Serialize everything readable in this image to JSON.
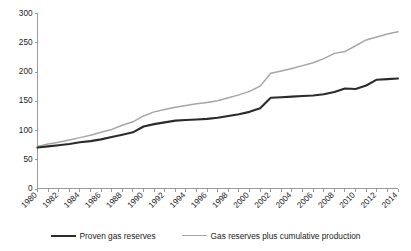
{
  "chart_data": {
    "type": "line",
    "title": "",
    "subtitle": "",
    "xlabel": "",
    "ylabel": "",
    "xlim": [
      1980,
      2014
    ],
    "ylim": [
      0,
      300
    ],
    "yticks": [
      0,
      50,
      100,
      150,
      200,
      250,
      300
    ],
    "grid": false,
    "legend_position": "bottom",
    "x": [
      1980,
      1981,
      1982,
      1983,
      1984,
      1985,
      1986,
      1987,
      1988,
      1989,
      1990,
      1991,
      1992,
      1993,
      1994,
      1995,
      1996,
      1997,
      1998,
      1999,
      2000,
      2001,
      2002,
      2003,
      2004,
      2005,
      2006,
      2007,
      2008,
      2009,
      2010,
      2011,
      2012,
      2013,
      2014
    ],
    "xtick_labels": [
      "1980",
      "1982",
      "1984",
      "1986",
      "1988",
      "1990",
      "1992",
      "1994",
      "1996",
      "1998",
      "2000",
      "2002",
      "2004",
      "2006",
      "2008",
      "2010",
      "2012",
      "2014"
    ],
    "series": [
      {
        "name": "Proven gas reserves",
        "color": "#2b2b2b",
        "values": [
          70,
          72,
          74,
          76,
          79,
          81,
          84,
          88,
          92,
          96,
          106,
          110,
          113,
          116,
          117,
          118,
          119,
          121,
          124,
          127,
          131,
          137,
          155,
          156,
          157,
          158,
          159,
          161,
          165,
          171,
          170,
          176,
          186,
          187,
          188
        ]
      },
      {
        "name": "Gas reserves plus cumulative production",
        "color": "#a6a6a6",
        "values": [
          72,
          76,
          79,
          83,
          87,
          91,
          96,
          101,
          108,
          114,
          124,
          131,
          135,
          139,
          142,
          145,
          147,
          150,
          155,
          160,
          166,
          175,
          197,
          201,
          205,
          210,
          215,
          222,
          231,
          234,
          244,
          254,
          259,
          264,
          268
        ]
      }
    ]
  },
  "legend": {
    "entries": [
      {
        "label": "Proven gas reserves",
        "color": "#2b2b2b"
      },
      {
        "label": "Gas reserves plus cumulative production",
        "color": "#a6a6a6"
      }
    ]
  },
  "axes": {
    "y_tick_labels": [
      "300",
      "250",
      "200",
      "150",
      "100",
      "50",
      "0"
    ],
    "x_tick_labels": [
      "1980",
      "1982",
      "1984",
      "1986",
      "1988",
      "1990",
      "1992",
      "1994",
      "1996",
      "1998",
      "2000",
      "2002",
      "2004",
      "2006",
      "2008",
      "2010",
      "2012",
      "2014"
    ]
  },
  "colors": {
    "primary_series": "#2b2b2b",
    "secondary_series": "#a6a6a6",
    "axis": "#9a9a9a",
    "text": "#1a1a1a",
    "background": "#ffffff"
  }
}
